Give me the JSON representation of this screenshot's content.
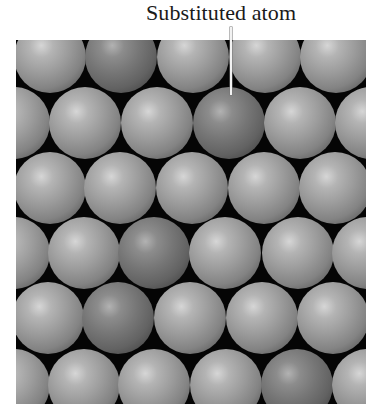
{
  "figure": {
    "label": "Substituted atom",
    "colors": {
      "background": "#050505",
      "host_atom": "#9c9c9c",
      "substituted_atom": "#767676",
      "label_text": "#1a1a1a",
      "leader_line": "#f2f2f2"
    },
    "frame": {
      "x": 16,
      "y": 40,
      "width": 350,
      "height": 364
    },
    "atom_radius": 36,
    "rows": [
      {
        "cy": 17,
        "atoms": [
          {
            "cx": 34,
            "type": "host"
          },
          {
            "cx": 105,
            "type": "substituted"
          },
          {
            "cx": 177,
            "type": "host"
          },
          {
            "cx": 249,
            "type": "host"
          },
          {
            "cx": 320,
            "type": "host"
          }
        ]
      },
      {
        "cy": 83,
        "atoms": [
          {
            "cx": -2,
            "type": "host"
          },
          {
            "cx": 69,
            "type": "host"
          },
          {
            "cx": 141,
            "type": "host"
          },
          {
            "cx": 213,
            "type": "substituted"
          },
          {
            "cx": 284,
            "type": "host"
          },
          {
            "cx": 355,
            "type": "host"
          }
        ]
      },
      {
        "cy": 148,
        "atoms": [
          {
            "cx": 34,
            "type": "host"
          },
          {
            "cx": 104,
            "type": "host"
          },
          {
            "cx": 176,
            "type": "host"
          },
          {
            "cx": 248,
            "type": "host"
          },
          {
            "cx": 319,
            "type": "host"
          }
        ]
      },
      {
        "cy": 213,
        "atoms": [
          {
            "cx": -2,
            "type": "host"
          },
          {
            "cx": 68,
            "type": "host"
          },
          {
            "cx": 138,
            "type": "substituted"
          },
          {
            "cx": 209,
            "type": "host"
          },
          {
            "cx": 282,
            "type": "host"
          },
          {
            "cx": 352,
            "type": "host"
          }
        ]
      },
      {
        "cy": 278,
        "atoms": [
          {
            "cx": 32,
            "type": "host"
          },
          {
            "cx": 102,
            "type": "substituted"
          },
          {
            "cx": 174,
            "type": "host"
          },
          {
            "cx": 246,
            "type": "host"
          },
          {
            "cx": 317,
            "type": "host"
          }
        ]
      },
      {
        "cy": 345,
        "atoms": [
          {
            "cx": -2,
            "type": "host"
          },
          {
            "cx": 68,
            "type": "host"
          },
          {
            "cx": 138,
            "type": "host"
          },
          {
            "cx": 210,
            "type": "host"
          },
          {
            "cx": 281,
            "type": "substituted"
          },
          {
            "cx": 352,
            "type": "host"
          }
        ]
      }
    ]
  }
}
